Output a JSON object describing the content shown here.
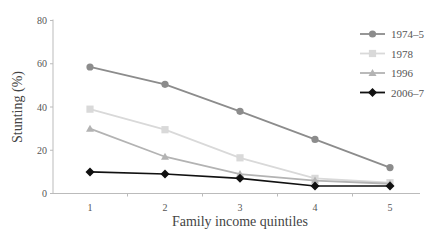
{
  "chart_data": {
    "type": "line",
    "title": "",
    "xlabel": "Family income quintiles",
    "ylabel": "Stunting (%)",
    "categories": [
      "1",
      "2",
      "3",
      "4",
      "5"
    ],
    "ylim": [
      0,
      80
    ],
    "yticks": [
      0,
      20,
      40,
      60,
      80
    ],
    "grid": false,
    "legend_position": "upper right",
    "series": [
      {
        "name": "1974–5",
        "color": "#8c8c8c",
        "marker": "circle",
        "values": [
          58.5,
          50.5,
          38,
          25,
          12
        ]
      },
      {
        "name": "1978",
        "color": "#d9d9d9",
        "marker": "square",
        "values": [
          39,
          29.5,
          16.5,
          7,
          5
        ]
      },
      {
        "name": "1996",
        "color": "#b3b3b3",
        "marker": "triangle",
        "values": [
          30,
          17,
          9,
          6,
          4.5
        ]
      },
      {
        "name": "2006–7",
        "color": "#111111",
        "marker": "diamond",
        "values": [
          10,
          9,
          7,
          3.5,
          3.5
        ]
      }
    ]
  }
}
